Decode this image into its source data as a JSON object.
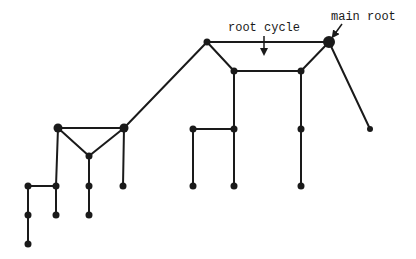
{
  "diagram": {
    "type": "graph",
    "title": "",
    "colors": {
      "ink": "#1a1a1a",
      "background": "#ffffff"
    },
    "labels": [
      {
        "id": "root_cycle",
        "text": "root cycle",
        "x": 228,
        "y": 22,
        "arrow": {
          "x1": 264,
          "y1": 36,
          "x2": 264,
          "y2": 52
        }
      },
      {
        "id": "main_root",
        "text": "main root",
        "x": 331,
        "y": 11,
        "arrow": {
          "x1": 342,
          "y1": 24,
          "x2": 334,
          "y2": 35
        }
      }
    ],
    "nodes": [
      {
        "id": "main_root",
        "x": 329,
        "y": 42,
        "r": 6
      },
      {
        "id": "c_tl",
        "x": 207,
        "y": 42,
        "r": 3.5
      },
      {
        "id": "c_bl",
        "x": 234,
        "y": 71,
        "r": 3.5
      },
      {
        "id": "c_br",
        "x": 301,
        "y": 71,
        "r": 3.5
      },
      {
        "id": "r_leaf",
        "x": 370,
        "y": 129,
        "r": 3
      },
      {
        "id": "m1",
        "x": 193,
        "y": 129,
        "r": 3.5
      },
      {
        "id": "m2",
        "x": 234,
        "y": 129,
        "r": 3.5
      },
      {
        "id": "m3",
        "x": 301,
        "y": 129,
        "r": 3.5
      },
      {
        "id": "m4",
        "x": 193,
        "y": 186,
        "r": 3.5
      },
      {
        "id": "m5",
        "x": 234,
        "y": 186,
        "r": 3.5
      },
      {
        "id": "m6",
        "x": 301,
        "y": 186,
        "r": 3.5
      },
      {
        "id": "t_l",
        "x": 58,
        "y": 128,
        "r": 4.5
      },
      {
        "id": "t_r",
        "x": 124,
        "y": 128,
        "r": 4.5
      },
      {
        "id": "t_b",
        "x": 89,
        "y": 156,
        "r": 3.5
      },
      {
        "id": "l1",
        "x": 28,
        "y": 186,
        "r": 3.5
      },
      {
        "id": "l2",
        "x": 56,
        "y": 186,
        "r": 3.5
      },
      {
        "id": "l3",
        "x": 89,
        "y": 186,
        "r": 3.5
      },
      {
        "id": "l4",
        "x": 123,
        "y": 186,
        "r": 3.5
      },
      {
        "id": "l5",
        "x": 28,
        "y": 215,
        "r": 3.5
      },
      {
        "id": "l6",
        "x": 56,
        "y": 215,
        "r": 3.5
      },
      {
        "id": "l7",
        "x": 89,
        "y": 215,
        "r": 3.5
      },
      {
        "id": "l8",
        "x": 28,
        "y": 244,
        "r": 3.5
      }
    ],
    "edges": [
      [
        "c_tl",
        "main_root"
      ],
      [
        "c_tl",
        "c_bl"
      ],
      [
        "c_bl",
        "c_br"
      ],
      [
        "c_br",
        "main_root"
      ],
      [
        "main_root",
        "r_leaf"
      ],
      [
        "c_bl",
        "m2"
      ],
      [
        "c_br",
        "m3"
      ],
      [
        "m1",
        "m2"
      ],
      [
        "m1",
        "m4"
      ],
      [
        "m2",
        "m5"
      ],
      [
        "m3",
        "m6"
      ],
      [
        "c_tl",
        "t_r"
      ],
      [
        "t_l",
        "t_r"
      ],
      [
        "t_l",
        "t_b"
      ],
      [
        "t_r",
        "t_b"
      ],
      [
        "t_l",
        "l2"
      ],
      [
        "t_r",
        "l4"
      ],
      [
        "t_b",
        "l3"
      ],
      [
        "l1",
        "l2"
      ],
      [
        "l1",
        "l5"
      ],
      [
        "l2",
        "l6"
      ],
      [
        "l3",
        "l7"
      ],
      [
        "l5",
        "l8"
      ]
    ]
  }
}
